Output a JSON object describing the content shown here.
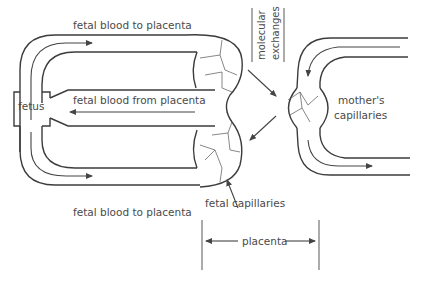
{
  "diagram": {
    "labels": {
      "top_flow": "fetal blood to placenta",
      "middle_flow": "fetal blood from placenta",
      "bottom_flow": "fetal blood to placenta",
      "fetus": "fetus",
      "exchange_line1": "molecular",
      "exchange_line2": "exchanges",
      "mother": "mother's",
      "mother_line2": "capillaries",
      "fetal_capillaries": "fetal capillaries",
      "placenta": "placenta"
    },
    "colors": {
      "line": "#3c3c3c",
      "text": "#4a4a4a",
      "background": "#ffffff"
    }
  }
}
